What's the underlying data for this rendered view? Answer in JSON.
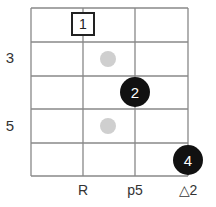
{
  "chord_diagram": {
    "grid": {
      "left": 31,
      "top": 8,
      "right": 188,
      "bottom": 176,
      "columns_x": [
        31,
        83,
        135,
        188
      ],
      "rows_y": [
        8,
        42,
        76,
        109,
        143,
        176
      ],
      "line_color": "#888888"
    },
    "fret_numbers": [
      {
        "label": "3",
        "x": 10,
        "y": 57
      },
      {
        "label": "5",
        "x": 10,
        "y": 125
      }
    ],
    "string_labels": [
      {
        "label": "R",
        "x": 83,
        "y": 190
      },
      {
        "label": "p5",
        "x": 135,
        "y": 190
      },
      {
        "label": "△2",
        "x": 188,
        "y": 190
      }
    ],
    "fingers": [
      {
        "label": "1",
        "style": "box",
        "x": 83,
        "y": 24
      },
      {
        "label": "2",
        "style": "black-dot",
        "x": 135,
        "y": 92,
        "r": 15
      },
      {
        "label": "4",
        "style": "black-dot",
        "x": 188,
        "y": 160,
        "r": 15
      }
    ],
    "markers": [
      {
        "style": "grey-dot",
        "x": 108,
        "y": 59,
        "r": 8
      },
      {
        "style": "grey-dot",
        "x": 108,
        "y": 126,
        "r": 8
      }
    ]
  }
}
